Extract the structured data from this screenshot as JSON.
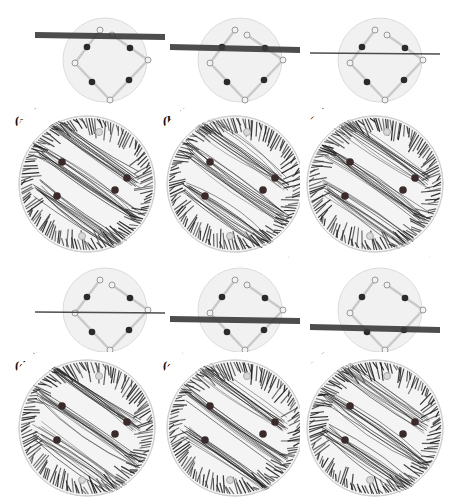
{
  "figure": {
    "panels": [
      {
        "id": "a",
        "label": "(a)",
        "plane_position": "top",
        "plane_tilt": 2
      },
      {
        "id": "b",
        "label": "(b)",
        "plane_position": "upper",
        "plane_tilt": 3
      },
      {
        "id": "c",
        "label": "(c)",
        "plane_position": "upper-middle",
        "plane_tilt": 1
      },
      {
        "id": "d",
        "label": "(d)",
        "plane_position": "middle",
        "plane_tilt": 1
      },
      {
        "id": "e",
        "label": "(e)",
        "plane_position": "lower-middle",
        "plane_tilt": 2
      },
      {
        "id": "f",
        "label": "(f)",
        "plane_position": "lower",
        "plane_tilt": 3
      }
    ],
    "colors": {
      "sphere": "#e6e6e6",
      "linkage": "#c9c9c9",
      "joint_dark": "#2b2b2b",
      "joint_light": "#f2f2f2",
      "plane": "#3a3a3a",
      "streamline": "#1e1e1e",
      "disk": "#f4f4f4"
    }
  }
}
